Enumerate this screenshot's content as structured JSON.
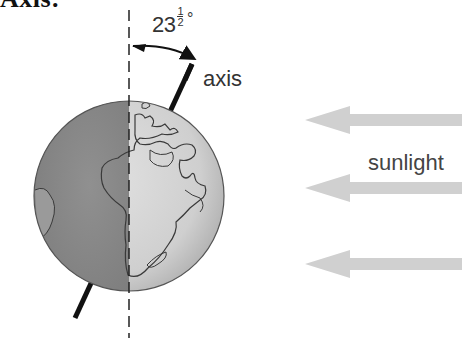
{
  "heading": {
    "text": "Axis:"
  },
  "diagram": {
    "tilt_angle": {
      "whole": "23",
      "frac_numerator": "1",
      "frac_denominator": "2",
      "degree_symbol": "°"
    },
    "axis_label": "axis",
    "sunlight_label": "sunlight",
    "sunlight_arrow_count": 3,
    "colors": {
      "night_side": "#8a8a8a",
      "day_side": "#d2d2d2",
      "outline": "#444444",
      "axis_line": "#111111",
      "sun_arrow": "#cfcfcf",
      "text": "#333333"
    }
  }
}
